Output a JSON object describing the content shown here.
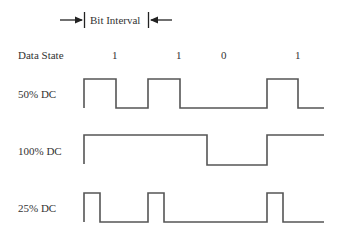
{
  "header": {
    "bit_interval_label": "Bit Interval"
  },
  "data_state": {
    "label": "Data State",
    "bits": [
      "1",
      "1",
      "0",
      "1"
    ]
  },
  "rows": [
    {
      "label": "50% DC"
    },
    {
      "label": "100% DC"
    },
    {
      "label": "25% DC"
    }
  ],
  "colors": {
    "waveform": "#555555",
    "text": "#333333",
    "background": "#ffffff"
  }
}
